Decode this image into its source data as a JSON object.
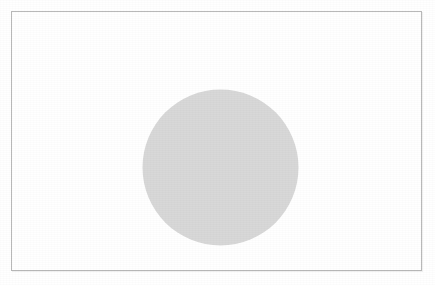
{
  "chart_data": {
    "type": "pie",
    "xlabel": "",
    "ylabel": "",
    "legend": "none",
    "grid": false,
    "labels_position": "outside-with-leader-lines",
    "categories": [
      "Blue",
      "Red",
      "Green",
      "Purple",
      "Cyan"
    ],
    "values": [
      13,
      22,
      9,
      19,
      38
    ],
    "value_unit": "percent",
    "start_angle_deg": 0,
    "direction": "clockwise",
    "slice_colors": [
      "#4a4a4a",
      "#b5b5b5",
      "#808080",
      "#3a3a3a",
      "#9a9a9a"
    ],
    "data_labels": [
      "13% Blue",
      "22% Red",
      "9% Green",
      "19% Purple",
      "38% Cyan"
    ],
    "slices": [
      {
        "name": "Blue",
        "value": 13,
        "label": "13% Blue",
        "color": "#4a4a4a"
      },
      {
        "name": "Red",
        "value": 22,
        "label": "22% Red",
        "color": "#b5b5b5"
      },
      {
        "name": "Green",
        "value": 9,
        "label": "9% Green",
        "color": "#808080"
      },
      {
        "name": "Purple",
        "value": 19,
        "label": "19% Purple",
        "color": "#3a3a3a"
      },
      {
        "name": "Cyan",
        "value": 38,
        "label": "38% Cyan",
        "color": "#9a9a9a"
      }
    ]
  },
  "frame": {
    "border_color": "#b9b9b9",
    "background": "#ffffff"
  }
}
